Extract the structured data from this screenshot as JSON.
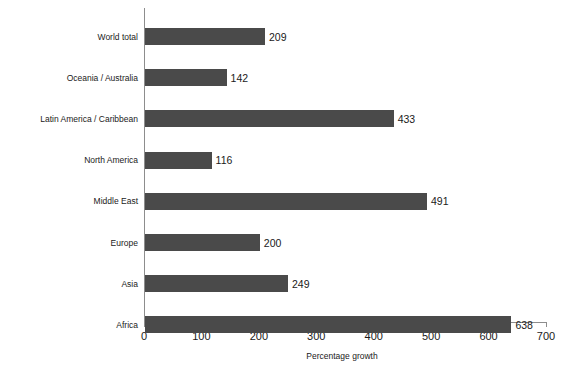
{
  "chart_data": {
    "type": "bar",
    "orientation": "horizontal",
    "title": "",
    "xlabel": "Percentage growth",
    "ylabel": "",
    "xlim": [
      0,
      700
    ],
    "xticks": [
      0,
      100,
      200,
      300,
      400,
      500,
      600,
      700
    ],
    "grid": false,
    "legend": null,
    "bar_color": "#4a4a4a",
    "axis_color": "#8d8d8d",
    "categories": [
      "World total",
      "Oceania / Australia",
      "Latin America / Caribbean",
      "North America",
      "Middle East",
      "Europe",
      "Asia",
      "Africa"
    ],
    "values": [
      209,
      142,
      433,
      116,
      491,
      200,
      249,
      638
    ],
    "value_labels": [
      "209",
      "142",
      "433",
      "116",
      "491",
      "200",
      "249",
      "638"
    ]
  }
}
